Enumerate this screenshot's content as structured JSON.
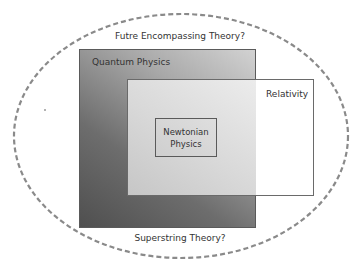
{
  "diagram": {
    "type": "nested-sets",
    "title": "",
    "outer": {
      "label": "Futre Encompassing Theory?",
      "shape": "dashed-ellipse",
      "stroke": "#8a8a8a"
    },
    "quantum": {
      "label": "Quantum Physics",
      "fill_dark": "#4f4f4f",
      "fill_light": "#d2d2d2"
    },
    "relativity": {
      "label": "Relativity",
      "fill": "#ffffff"
    },
    "newtonian": {
      "line1": "Newtonian",
      "line2": "Physics"
    },
    "bottom": {
      "label": "Superstring Theory?"
    },
    "relationships": [
      {
        "inner": "Newtonian Physics",
        "contained_in": [
          "Quantum Physics",
          "Relativity"
        ]
      },
      {
        "overlap": [
          "Quantum Physics",
          "Relativity"
        ]
      },
      {
        "inner": "Quantum Physics",
        "contained_in": [
          "Futre Encompassing Theory?"
        ]
      },
      {
        "inner": "Relativity",
        "contained_in": [
          "Futre Encompassing Theory?"
        ]
      }
    ]
  }
}
